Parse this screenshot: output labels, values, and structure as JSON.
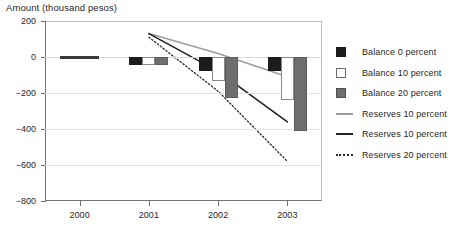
{
  "chart_data": {
    "type": "bar",
    "title": "Amount (thousand pesos)",
    "xlabel": "",
    "ylabel": "Amount (thousand pesos)",
    "categories": [
      "2000",
      "2001",
      "2002",
      "2003"
    ],
    "ylim": [
      -800,
      200
    ],
    "yticks": [
      200,
      0,
      -200,
      -400,
      -600,
      -800
    ],
    "ytick_labels": [
      "200",
      "0",
      "-200",
      "-400",
      "-600",
      "-800"
    ],
    "grid": false,
    "legend_position": "right",
    "series": [
      {
        "name": "Balance 0 percent",
        "kind": "bar",
        "color": "#1c1c1c",
        "values": [
          0,
          -45,
          -75,
          -80
        ]
      },
      {
        "name": "Balance 10 percent",
        "kind": "bar",
        "color": "#ffffff",
        "values": [
          0,
          -45,
          -135,
          -240
        ]
      },
      {
        "name": "Balance 20 percent",
        "kind": "bar",
        "color": "#6e6e6e",
        "values": [
          0,
          -45,
          -225,
          -410
        ]
      },
      {
        "name": "Reserves 10 percent",
        "kind": "line",
        "style": "solid",
        "color": "#9d9d9d",
        "x": [
          "2001",
          "2002",
          "2003"
        ],
        "values": [
          130,
          20,
          -110
        ]
      },
      {
        "name": "Reserves 10 percent",
        "kind": "line",
        "style": "solid",
        "color": "#222222",
        "x": [
          "2001",
          "2002",
          "2003"
        ],
        "values": [
          130,
          -80,
          -360
        ]
      },
      {
        "name": "Reserves 20 percent",
        "kind": "line",
        "style": "dotted",
        "color": "#2a2a2a",
        "x": [
          "2001",
          "2002",
          "2003"
        ],
        "values": [
          110,
          -190,
          -580
        ]
      }
    ]
  },
  "legend": {
    "items": [
      {
        "label": "Balance 0 percent",
        "key": "swatch-black"
      },
      {
        "label": "Balance 10 percent",
        "key": "swatch-white"
      },
      {
        "label": "Balance 20 percent",
        "key": "swatch-gray"
      },
      {
        "label": "Reserves 10 percent",
        "key": "line-gray-solid"
      },
      {
        "label": "Reserves 10 percent",
        "key": "line-black-solid"
      },
      {
        "label": "Reserves 20 percent",
        "key": "line-black-dotted"
      }
    ]
  }
}
